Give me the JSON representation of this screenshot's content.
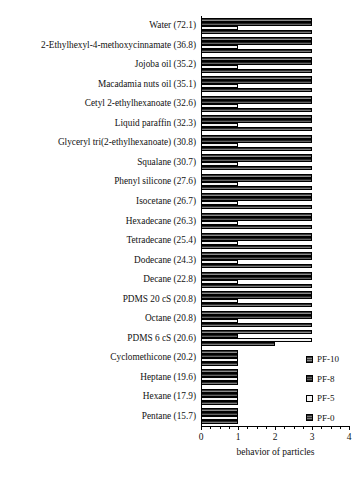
{
  "chart_data": {
    "type": "bar",
    "orientation": "horizontal-grouped",
    "title": "",
    "xlabel": "behavior of particles",
    "ylabel": "",
    "xlim": [
      0,
      4
    ],
    "xticks": [
      0,
      1,
      2,
      3,
      4
    ],
    "xtick_labels": [
      "0",
      "1",
      "2",
      "3",
      "4"
    ],
    "grid": false,
    "legend_position": "right-lower",
    "categories": [
      "Water (72.1)",
      "2-Ethylhexyl-4-methoxycinnamate (36.8)",
      "Jojoba oil (35.2)",
      "Macadamia nuts oil (35.1)",
      "Cetyl 2-ethylhexanoate (32.6)",
      "Liquid paraffin (32.3)",
      "Glyceryl tri(2-ethylhexanoate) (30.8)",
      "Squalane (30.7)",
      "Phenyl silicone (27.6)",
      "Isocetane (26.7)",
      "Hexadecane (26.3)",
      "Tetradecane (25.4)",
      "Dodecane (24.3)",
      "Decane (22.8)",
      "PDMS 20 cS (20.8)",
      "Octane (20.8)",
      "PDMS 6 cS (20.6)",
      "Cyclomethicone (20.2)",
      "Heptane (19.6)",
      "Hexane (17.9)",
      "Pentane (15.7)"
    ],
    "series": [
      {
        "name": "PF-10",
        "color": "#6d6d6d",
        "values": [
          3,
          3,
          3,
          3,
          3,
          3,
          3,
          3,
          3,
          3,
          3,
          3,
          3,
          3,
          3,
          3,
          3,
          1,
          1,
          1,
          1
        ]
      },
      {
        "name": "PF-8",
        "color": "#4a4a4a",
        "values": [
          3,
          3,
          3,
          3,
          3,
          3,
          3,
          3,
          3,
          3,
          3,
          3,
          3,
          3,
          3,
          3,
          1,
          1,
          1,
          1,
          1
        ]
      },
      {
        "name": "PF-5",
        "color": "#f2f2f2",
        "values": [
          1,
          1,
          1,
          1,
          1,
          1,
          1,
          1,
          1,
          1,
          1,
          1,
          1,
          1,
          1,
          1,
          3,
          1,
          1,
          1,
          1
        ]
      },
      {
        "name": "PF-0",
        "color": "#5e5e5e",
        "values": [
          3,
          3,
          3,
          3,
          3,
          3,
          3,
          3,
          3,
          3,
          3,
          3,
          3,
          3,
          3,
          3,
          2,
          1,
          1,
          1,
          1
        ]
      }
    ]
  },
  "legend": {
    "items": [
      {
        "label": "PF-10",
        "series": "PF-10"
      },
      {
        "label": "PF-8",
        "series": "PF-8"
      },
      {
        "label": "PF-5",
        "series": "PF-5"
      },
      {
        "label": "PF-0",
        "series": "PF-0"
      }
    ]
  },
  "axis": {
    "x_title": "behavior of particles"
  }
}
